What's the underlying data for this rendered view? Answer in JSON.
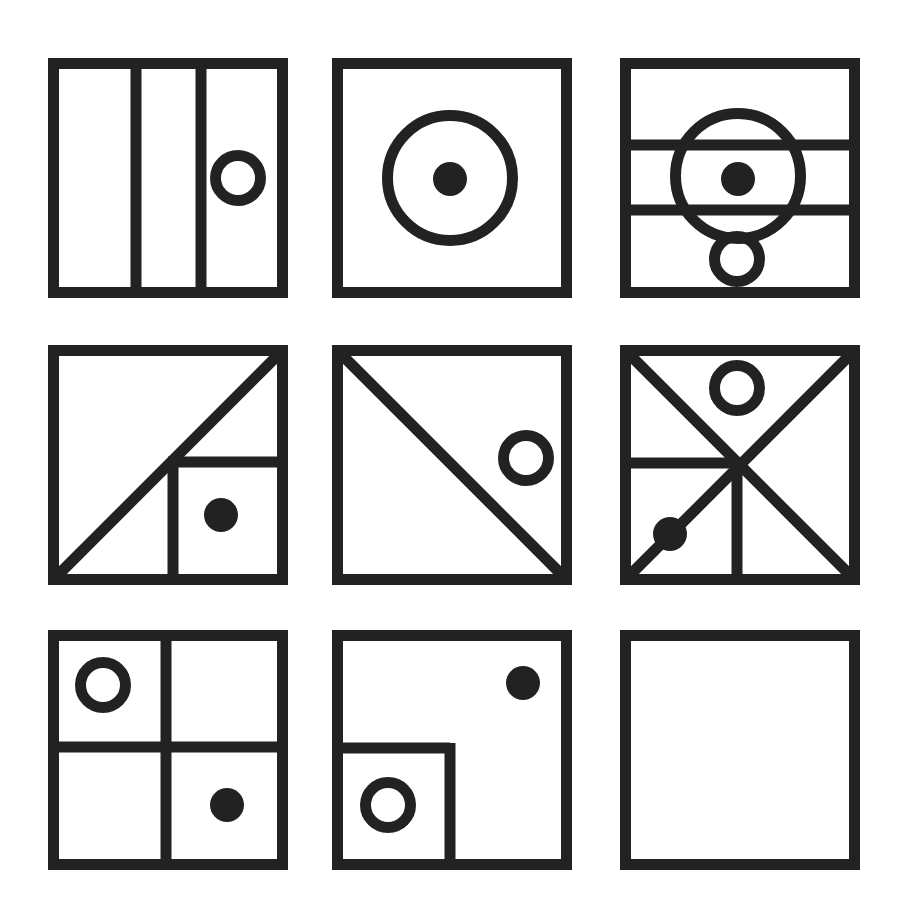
{
  "figure": {
    "type": "matrix-reasoning-puzzle",
    "rows": 3,
    "cols": 3,
    "background": "#ffffff",
    "ink": "#222222",
    "stroke_width": 11,
    "panel_size": 240,
    "panels": [
      {
        "id": "r1c1",
        "row": 1,
        "col": 1,
        "x": 48,
        "y": 58,
        "description": "square split into three vertical strips, hollow circle in right strip",
        "lines": [
          [
            88,
            0,
            88,
            240
          ],
          [
            153,
            0,
            153,
            240
          ]
        ],
        "circles": [
          {
            "cx": 190,
            "cy": 120,
            "r": 28,
            "filled": false
          }
        ]
      },
      {
        "id": "r1c2",
        "row": 1,
        "col": 2,
        "x": 332,
        "y": 58,
        "description": "large hollow circle with filled dot at center",
        "lines": [],
        "circles": [
          {
            "cx": 118,
            "cy": 120,
            "r": 68,
            "filled": false
          },
          {
            "cx": 118,
            "cy": 121,
            "r": 17,
            "filled": true
          }
        ]
      },
      {
        "id": "r1c3",
        "row": 1,
        "col": 3,
        "x": 620,
        "y": 58,
        "description": "square split into three horizontal bands, large hollow circle with dot, small hollow circle below touching bottom",
        "lines": [
          [
            0,
            87,
            240,
            87
          ],
          [
            0,
            152,
            240,
            152
          ]
        ],
        "circles": [
          {
            "cx": 118,
            "cy": 118,
            "r": 68,
            "filled": false
          },
          {
            "cx": 118,
            "cy": 121,
            "r": 17,
            "filled": true
          },
          {
            "cx": 117,
            "cy": 201,
            "r": 28,
            "filled": false
          }
        ]
      },
      {
        "id": "r2c1",
        "row": 2,
        "col": 1,
        "x": 48,
        "y": 345,
        "description": "diagonal from bottom-left to top-right, small square in lower right with filled dot",
        "lines": [
          [
            6,
            234,
            234,
            6
          ],
          [
            120,
            117,
            240,
            117
          ],
          [
            125,
            117,
            125,
            240
          ]
        ],
        "circles": [
          {
            "cx": 173,
            "cy": 170,
            "r": 17,
            "filled": true
          }
        ]
      },
      {
        "id": "r2c2",
        "row": 2,
        "col": 2,
        "x": 332,
        "y": 345,
        "description": "diagonal from top-left to bottom-right, hollow circle touching right edge",
        "lines": [
          [
            6,
            6,
            234,
            234
          ]
        ],
        "circles": [
          {
            "cx": 194,
            "cy": 113,
            "r": 28,
            "filled": false
          }
        ]
      },
      {
        "id": "r2c3",
        "row": 2,
        "col": 3,
        "x": 620,
        "y": 345,
        "description": "both diagonals, horizontal half line on left, vertical half line below center, hollow circle at top, filled dot on lower-left diagonal",
        "lines": [
          [
            6,
            6,
            234,
            234
          ],
          [
            6,
            234,
            234,
            6
          ],
          [
            0,
            118,
            120,
            118
          ],
          [
            117,
            118,
            117,
            240
          ]
        ],
        "circles": [
          {
            "cx": 117,
            "cy": 43,
            "r": 28,
            "filled": false
          },
          {
            "cx": 50,
            "cy": 189,
            "r": 17,
            "filled": true
          }
        ]
      },
      {
        "id": "r3c1",
        "row": 3,
        "col": 1,
        "x": 48,
        "y": 630,
        "description": "four quadrants, hollow circle top-left, filled dot bottom-right",
        "lines": [
          [
            118,
            0,
            118,
            240
          ],
          [
            0,
            117,
            240,
            117
          ]
        ],
        "circles": [
          {
            "cx": 55,
            "cy": 55,
            "r": 28,
            "filled": false
          },
          {
            "cx": 179,
            "cy": 175,
            "r": 17,
            "filled": true
          }
        ]
      },
      {
        "id": "r3c2",
        "row": 3,
        "col": 2,
        "x": 332,
        "y": 630,
        "description": "small square in lower-left with hollow circle, filled dot upper right",
        "lines": [
          [
            0,
            118,
            118,
            118
          ],
          [
            118,
            113,
            118,
            240
          ]
        ],
        "circles": [
          {
            "cx": 56,
            "cy": 175,
            "r": 28,
            "filled": false
          },
          {
            "cx": 191,
            "cy": 53,
            "r": 17,
            "filled": true
          }
        ]
      },
      {
        "id": "r3c3",
        "row": 3,
        "col": 3,
        "x": 620,
        "y": 630,
        "description": "empty square (missing answer)",
        "lines": [],
        "circles": []
      }
    ]
  }
}
